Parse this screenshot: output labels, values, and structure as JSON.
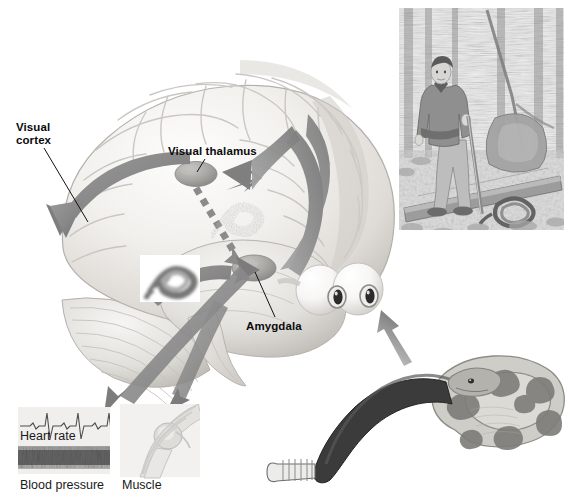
{
  "figure": {
    "kind": "scientific-illustration",
    "background_color": "#ffffff",
    "palette": {
      "brain_light": "#f4f3f1",
      "brain_mid": "#dcdad6",
      "brain_shadow": "#b9b6b1",
      "arrow_gray": "#8d8d8d",
      "arrow_dark": "#6f6f6f",
      "nucleus_gray": "#a9a7a5",
      "label_black": "#0b0b0b",
      "photo_gray": "#9a9a9a"
    }
  },
  "labels": {
    "visual_cortex": "Visual\ncortex",
    "visual_cortex_line1": "Visual",
    "visual_cortex_line2": "cortex",
    "visual_thalamus": "Visual thalamus",
    "amygdala": "Amygdala"
  },
  "response_panels": [
    {
      "id": "heart-rate",
      "caption": "Heart rate",
      "trace": "ecg"
    },
    {
      "id": "blood-pressure",
      "caption": "Blood pressure",
      "trace": "pressure-noise"
    },
    {
      "id": "muscle",
      "caption": "Muscle",
      "trace": "knee-anatomy"
    }
  ],
  "insets": {
    "scene_photo": {
      "name": "hiker-encountering-rattlesnake",
      "description": "Man in jacket standing on a log path in a pine forest, holding a walking stick, with a coiled rattlesnake near his feet"
    },
    "snake_illustration": {
      "name": "coiled-rattlesnake",
      "description": "Coiled rattlesnake with banded body, dark tail and rattle"
    },
    "eyes": {
      "name": "pair-of-eyes",
      "description": "Pair of eyeballs viewing the snake"
    },
    "sharp_snake_thumbnail": {
      "name": "sharp-snake-image",
      "description": "Clear detailed snake image representing cortical processing"
    },
    "blurry_snake_thumbnail": {
      "name": "coarse-snake-image",
      "description": "Coarse, blurry snake image representing rapid thalamic processing"
    }
  },
  "pathways": [
    {
      "id": "eye-to-thalamus",
      "from": "eyes",
      "to": "visual thalamus",
      "style": "solid"
    },
    {
      "id": "thalamus-to-cortex",
      "from": "visual thalamus",
      "to": "visual cortex",
      "style": "solid"
    },
    {
      "id": "thalamus-to-amygdala",
      "from": "visual thalamus",
      "to": "amygdala",
      "style": "dashed"
    },
    {
      "id": "cortex-to-amygdala",
      "from": "visual cortex",
      "to": "amygdala",
      "style": "solid"
    },
    {
      "id": "amygdala-to-body",
      "from": "amygdala",
      "to": "bodily responses",
      "style": "solid"
    },
    {
      "id": "snake-to-eyes",
      "from": "snake",
      "to": "eyes",
      "style": "solid"
    }
  ]
}
